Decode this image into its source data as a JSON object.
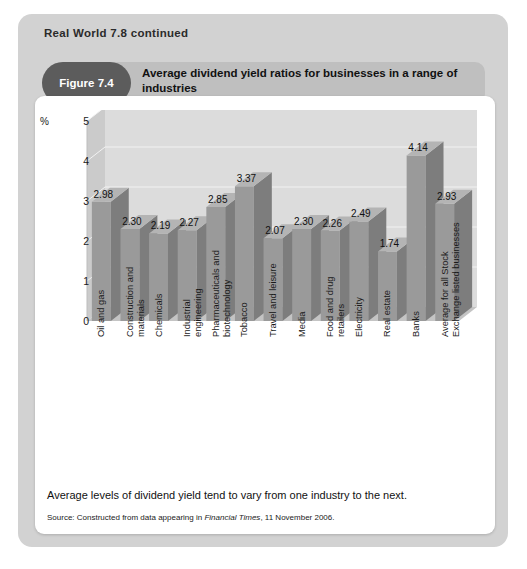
{
  "panel": {
    "real_world_title": "Real World 7.8 continued"
  },
  "figure": {
    "badge": "Figure 7.4",
    "title": "Average dividend yield ratios for businesses in a range of industries"
  },
  "footer": {
    "caption": "Average levels of dividend yield tend to vary from one industry to the next.",
    "source_prefix": "Source: Constructed from data appearing in ",
    "source_italic": "Financial Times",
    "source_suffix": ", 11 November 2006."
  },
  "colors": {
    "panel_grey": "#d2d2d2",
    "band_grey": "#bfbfbf",
    "badge_grey": "#5c5c5c",
    "bar_front": "#9a9a9a",
    "bar_side": "#7d7d7d",
    "bar_top": "#b4b4b4",
    "plot_back": "#dcdcdc",
    "plot_wall": "#cbcbcb",
    "plot_floor": "#c4c4c4",
    "gridline": "#f2f2f2"
  },
  "chart_data": {
    "type": "bar",
    "title": "Average dividend yield ratios for businesses in a range of industries",
    "xlabel": "",
    "ylabel": "%",
    "ylim": [
      0,
      5
    ],
    "yticks": [
      0,
      1,
      2,
      3,
      4,
      5
    ],
    "ytick_labels": [
      "0",
      "1",
      "2",
      "3",
      "4",
      "5"
    ],
    "grid": true,
    "legend": false,
    "three_d": true,
    "categories": [
      "Oil and gas",
      "Construction and materials",
      "Chemicals",
      "Industrial engineering",
      "Pharmaceuticals and biotechnology",
      "Tobacco",
      "Travel and leisure",
      "Media",
      "Food and drug retailers",
      "Electricity",
      "Real estate",
      "Banks",
      "Average for all Stock Exchange listed businesses"
    ],
    "category_lines": [
      [
        "Oil and gas"
      ],
      [
        "Construction and",
        "materials"
      ],
      [
        "Chemicals"
      ],
      [
        "Industrial",
        "engineering"
      ],
      [
        "Pharmaceuticals and",
        "biotechnology"
      ],
      [
        "Tobacco"
      ],
      [
        "Travel and leisure"
      ],
      [
        "Media"
      ],
      [
        "Food and drug",
        "retailers"
      ],
      [
        "Electricity"
      ],
      [
        "Real estate"
      ],
      [
        "Banks"
      ],
      [
        "Average for all Stock",
        "Exchange listed businesses"
      ]
    ],
    "values": [
      2.98,
      2.3,
      2.19,
      2.27,
      2.85,
      3.37,
      2.07,
      2.3,
      2.26,
      2.49,
      1.74,
      4.14,
      2.93
    ],
    "value_labels": [
      "2.98",
      "2.30",
      "2.19",
      "2.27",
      "2.85",
      "3.37",
      "2.07",
      "2.30",
      "2.26",
      "2.49",
      "1.74",
      "4.14",
      "2.93"
    ]
  }
}
